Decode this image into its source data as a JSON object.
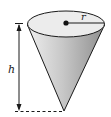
{
  "diagram": {
    "labels": {
      "height": "h",
      "radius": "r"
    },
    "colors": {
      "cone_fill_light": "#e4e4e4",
      "cone_fill_dark": "#9a9a9a",
      "top_fill": "#ebebeb",
      "stroke": "#1a1a1a"
    }
  }
}
